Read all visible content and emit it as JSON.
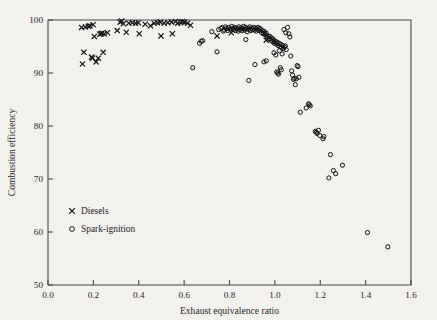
{
  "figure": {
    "background_color": "#f3f1ee",
    "frame_color": "#4a4a4a",
    "marker_color": "#111111"
  },
  "legend": {
    "position": "inside-lower-left",
    "entries": [
      {
        "label": "Diesels",
        "marker": "cross-icon",
        "symbol": "x"
      },
      {
        "label": "Spark-ignition",
        "marker": "circle-icon",
        "symbol": "o"
      }
    ]
  },
  "chart_data": {
    "type": "scatter",
    "title": "",
    "xlabel": "Exhaust equivalence ratio",
    "ylabel": "Combustion efficiency",
    "xlim": [
      0.0,
      1.6
    ],
    "ylim": [
      50,
      100
    ],
    "xticks": [
      0.0,
      0.2,
      0.4,
      0.6,
      0.8,
      1.0,
      1.2,
      1.4,
      1.6
    ],
    "xtick_labels": [
      "0.0",
      "0.2",
      "0.4",
      "0.6",
      "0.8",
      "1.0",
      "1.2",
      "1.4",
      "1.6"
    ],
    "yticks": [
      50,
      60,
      70,
      80,
      90,
      100
    ],
    "ytick_labels": [
      "50",
      "60",
      "70",
      "80",
      "90",
      "100"
    ],
    "grid": false,
    "legend_position": "lower left",
    "series": [
      {
        "name": "Diesels",
        "marker": "x",
        "points": [
          [
            0.148,
            98.6
          ],
          [
            0.152,
            91.7
          ],
          [
            0.158,
            93.9
          ],
          [
            0.165,
            98.7
          ],
          [
            0.178,
            98.8
          ],
          [
            0.185,
            98.9
          ],
          [
            0.192,
            93.0
          ],
          [
            0.196,
            92.8
          ],
          [
            0.199,
            99.1
          ],
          [
            0.204,
            96.9
          ],
          [
            0.212,
            92.1
          ],
          [
            0.222,
            92.8
          ],
          [
            0.228,
            97.3
          ],
          [
            0.234,
            97.4
          ],
          [
            0.238,
            97.5
          ],
          [
            0.243,
            93.9
          ],
          [
            0.248,
            97.4
          ],
          [
            0.262,
            97.6
          ],
          [
            0.305,
            98.0
          ],
          [
            0.318,
            99.6
          ],
          [
            0.325,
            99.8
          ],
          [
            0.332,
            99.3
          ],
          [
            0.345,
            97.7
          ],
          [
            0.356,
            99.4
          ],
          [
            0.372,
            99.5
          ],
          [
            0.386,
            99.4
          ],
          [
            0.398,
            99.5
          ],
          [
            0.402,
            97.4
          ],
          [
            0.428,
            99.2
          ],
          [
            0.452,
            98.9
          ],
          [
            0.468,
            99.4
          ],
          [
            0.482,
            99.5
          ],
          [
            0.495,
            99.6
          ],
          [
            0.498,
            97.0
          ],
          [
            0.512,
            99.4
          ],
          [
            0.528,
            99.5
          ],
          [
            0.545,
            99.6
          ],
          [
            0.548,
            97.4
          ],
          [
            0.562,
            99.7
          ],
          [
            0.572,
            99.4
          ],
          [
            0.585,
            99.5
          ],
          [
            0.592,
            99.7
          ],
          [
            0.602,
            99.6
          ],
          [
            0.615,
            99.4
          ],
          [
            0.628,
            99.0
          ],
          [
            0.745,
            97.0
          ],
          [
            0.808,
            97.6
          ],
          [
            0.962,
            96.2
          ]
        ]
      },
      {
        "name": "Spark-ignition",
        "marker": "o",
        "points": [
          [
            0.638,
            91.0
          ],
          [
            0.668,
            95.6
          ],
          [
            0.675,
            96.0
          ],
          [
            0.682,
            96.1
          ],
          [
            0.722,
            97.8
          ],
          [
            0.745,
            94.0
          ],
          [
            0.752,
            98.2
          ],
          [
            0.762,
            98.4
          ],
          [
            0.768,
            98.6
          ],
          [
            0.772,
            97.9
          ],
          [
            0.778,
            98.1
          ],
          [
            0.782,
            98.7
          ],
          [
            0.788,
            98.4
          ],
          [
            0.792,
            98.0
          ],
          [
            0.796,
            98.6
          ],
          [
            0.802,
            98.3
          ],
          [
            0.806,
            98.1
          ],
          [
            0.81,
            98.8
          ],
          [
            0.814,
            98.4
          ],
          [
            0.818,
            98.2
          ],
          [
            0.822,
            98.6
          ],
          [
            0.826,
            98.0
          ],
          [
            0.83,
            98.5
          ],
          [
            0.834,
            98.3
          ],
          [
            0.838,
            97.9
          ],
          [
            0.842,
            98.7
          ],
          [
            0.846,
            98.2
          ],
          [
            0.85,
            98.5
          ],
          [
            0.854,
            98.0
          ],
          [
            0.858,
            98.4
          ],
          [
            0.862,
            98.8
          ],
          [
            0.866,
            98.1
          ],
          [
            0.87,
            98.6
          ],
          [
            0.874,
            98.3
          ],
          [
            0.878,
            97.8
          ],
          [
            0.882,
            98.5
          ],
          [
            0.886,
            98.2
          ],
          [
            0.89,
            98.7
          ],
          [
            0.894,
            98.0
          ],
          [
            0.898,
            98.4
          ],
          [
            0.872,
            96.3
          ],
          [
            0.885,
            88.6
          ],
          [
            0.902,
            98.2
          ],
          [
            0.906,
            98.6
          ],
          [
            0.91,
            98.1
          ],
          [
            0.914,
            98.5
          ],
          [
            0.918,
            97.9
          ],
          [
            0.922,
            98.3
          ],
          [
            0.926,
            98.6
          ],
          [
            0.93,
            98.0
          ],
          [
            0.934,
            98.4
          ],
          [
            0.938,
            98.2
          ],
          [
            0.942,
            97.6
          ],
          [
            0.946,
            98.0
          ],
          [
            0.95,
            97.4
          ],
          [
            0.954,
            97.8
          ],
          [
            0.912,
            91.6
          ],
          [
            0.958,
            97.2
          ],
          [
            0.962,
            97.5
          ],
          [
            0.966,
            96.8
          ],
          [
            0.97,
            97.0
          ],
          [
            0.974,
            96.5
          ],
          [
            0.978,
            96.9
          ],
          [
            0.982,
            96.2
          ],
          [
            0.986,
            96.6
          ],
          [
            0.99,
            95.9
          ],
          [
            0.994,
            96.3
          ],
          [
            0.998,
            95.6
          ],
          [
            0.952,
            92.1
          ],
          [
            0.962,
            92.3
          ],
          [
            1.002,
            96.0
          ],
          [
            1.006,
            95.5
          ],
          [
            1.01,
            95.8
          ],
          [
            1.014,
            95.2
          ],
          [
            1.018,
            95.6
          ],
          [
            1.022,
            95.0
          ],
          [
            1.026,
            95.4
          ],
          [
            1.03,
            94.8
          ],
          [
            1.034,
            95.2
          ],
          [
            1.038,
            94.6
          ],
          [
            0.996,
            93.8
          ],
          [
            1.004,
            93.4
          ],
          [
            1.008,
            90.2
          ],
          [
            1.012,
            90.0
          ],
          [
            1.016,
            89.8
          ],
          [
            1.02,
            94.2
          ],
          [
            1.024,
            91.0
          ],
          [
            1.028,
            90.6
          ],
          [
            1.032,
            93.6
          ],
          [
            1.042,
            94.9
          ],
          [
            1.046,
            95.1
          ],
          [
            1.05,
            94.4
          ],
          [
            1.04,
            98.2
          ],
          [
            1.048,
            97.6
          ],
          [
            1.056,
            98.6
          ],
          [
            1.062,
            97.4
          ],
          [
            1.066,
            96.8
          ],
          [
            1.07,
            93.2
          ],
          [
            1.074,
            90.4
          ],
          [
            1.078,
            89.6
          ],
          [
            1.082,
            88.8
          ],
          [
            1.086,
            89.0
          ],
          [
            1.09,
            87.8
          ],
          [
            1.094,
            88.9
          ],
          [
            1.098,
            91.4
          ],
          [
            1.102,
            91.2
          ],
          [
            1.106,
            89.2
          ],
          [
            1.112,
            82.6
          ],
          [
            1.138,
            83.4
          ],
          [
            1.148,
            84.2
          ],
          [
            1.152,
            84.0
          ],
          [
            1.156,
            83.8
          ],
          [
            1.178,
            79.0
          ],
          [
            1.182,
            78.8
          ],
          [
            1.186,
            78.6
          ],
          [
            1.192,
            79.2
          ],
          [
            1.198,
            78.2
          ],
          [
            1.212,
            77.6
          ],
          [
            1.216,
            78.0
          ],
          [
            1.245,
            74.6
          ],
          [
            1.238,
            70.2
          ],
          [
            1.258,
            71.6
          ],
          [
            1.268,
            71.0
          ],
          [
            1.298,
            72.6
          ],
          [
            1.408,
            59.9
          ],
          [
            1.498,
            57.2
          ]
        ]
      }
    ]
  }
}
